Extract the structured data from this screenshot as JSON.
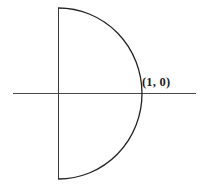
{
  "figure": {
    "background_color": "#ffffff",
    "width": 204,
    "height": 187,
    "labels": {
      "point_one_zero": "(1, 0)"
    },
    "label_positions": {
      "point_one_zero": {
        "x": 142,
        "y": 76
      }
    },
    "colors": {
      "axis": "#4a4a4a",
      "chord": "#3a3a3a",
      "arc": "#222222",
      "label_text": "#1d1d1d"
    }
  },
  "chart_data": {
    "type": "line",
    "title": "",
    "subtitle": "",
    "xlabel": "",
    "ylabel": "",
    "grid": false,
    "legend": null,
    "axis_line": {
      "name": "horizontal-axis",
      "x_start_px": 13,
      "x_end_px": 196,
      "y_px": 93
    },
    "series": [
      {
        "name": "vertical-chord",
        "kind": "segment",
        "x_px": 58,
        "y_start_px": 8,
        "y_end_px": 179
      },
      {
        "name": "semicircular-arc",
        "kind": "arc",
        "center_px": [
          58,
          93
        ],
        "radius_x_px": 83,
        "radius_y_px": 85,
        "start_px": [
          58,
          8
        ],
        "mid_px": [
          141,
          93
        ],
        "end_px": [
          58,
          179
        ],
        "sweep": "clockwise-right-bulge"
      }
    ],
    "annotations": [
      {
        "text": "(1, 0)",
        "anchor_px": [
          141,
          93
        ],
        "label_px": [
          142,
          76
        ],
        "describes": "intersection of the arc with the horizontal axis"
      }
    ],
    "axis_ranges": {
      "x_px": [
        0,
        204
      ],
      "y_px": [
        0,
        187
      ]
    }
  }
}
